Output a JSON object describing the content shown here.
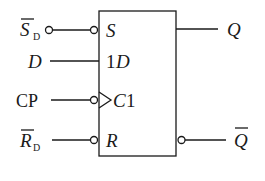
{
  "diagram": {
    "inputs": [
      {
        "id": "sd",
        "label_main": "S",
        "label_sub": "D",
        "overbar": true,
        "inverted": true,
        "pin_label": "S",
        "pin_italic": true
      },
      {
        "id": "d",
        "label_main": "D",
        "label_sub": "",
        "overbar": false,
        "inverted": false,
        "pin_label_prefix": "1",
        "pin_label": "D"
      },
      {
        "id": "cp",
        "label_main": "CP",
        "label_sub": "",
        "overbar": false,
        "inverted": true,
        "clock": true,
        "pin_label": "C",
        "pin_label_suffix": "1"
      },
      {
        "id": "rd",
        "label_main": "R",
        "label_sub": "D",
        "overbar": true,
        "inverted": true,
        "pin_label": "R",
        "pin_italic": true
      }
    ],
    "outputs": [
      {
        "id": "q",
        "label": "Q",
        "overbar": false,
        "inverted": false
      },
      {
        "id": "qn",
        "label": "Q",
        "overbar": true,
        "inverted": true
      }
    ],
    "colors": {
      "line": "#1a1a1a",
      "background": "#ffffff"
    }
  }
}
